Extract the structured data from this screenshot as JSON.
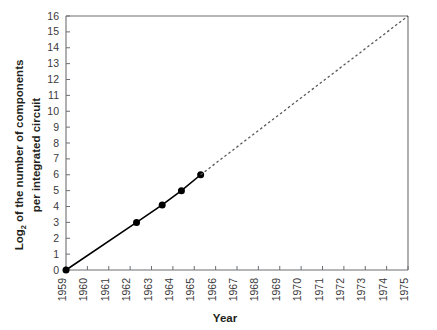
{
  "chart_data": {
    "type": "line",
    "title": "",
    "xlabel": "Year",
    "ylabel_line1": "Log",
    "ylabel_sub": "2",
    "ylabel_line1_rest": " of the number of components",
    "ylabel_line2": "per integrated circuit",
    "ylabel_full": "Log2 of the number of components per integrated circuit",
    "xlim": [
      1959,
      1975
    ],
    "ylim": [
      0,
      16
    ],
    "grid": false,
    "legend": "none",
    "x_tick_labels": [
      "1959",
      "1960",
      "1961",
      "1962",
      "1963",
      "1964",
      "1965",
      "1966",
      "1967",
      "1968",
      "1969",
      "1970",
      "1971",
      "1972",
      "1973",
      "1974",
      "1975"
    ],
    "y_tick_labels": [
      "0",
      "1",
      "2",
      "3",
      "4",
      "5",
      "6",
      "7",
      "8",
      "9",
      "10",
      "11",
      "12",
      "13",
      "14",
      "15",
      "16"
    ],
    "series": [
      {
        "name": "observed",
        "style": "solid-with-markers",
        "color": "#000000",
        "points": [
          {
            "x": 1959.0,
            "y": 0.0
          },
          {
            "x": 1962.3,
            "y": 3.0
          },
          {
            "x": 1963.5,
            "y": 4.1
          },
          {
            "x": 1964.4,
            "y": 5.0
          },
          {
            "x": 1965.3,
            "y": 6.0
          }
        ]
      },
      {
        "name": "extrapolation",
        "style": "dashed",
        "color": "#58595b",
        "points": [
          {
            "x": 1965.3,
            "y": 6.0
          },
          {
            "x": 1975.0,
            "y": 16.0
          }
        ]
      }
    ],
    "axis_color": "#6d6e71",
    "marker_size_px": 7
  }
}
